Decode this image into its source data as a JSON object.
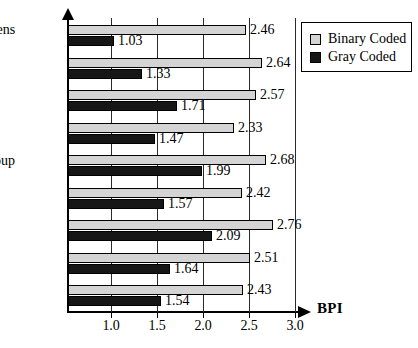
{
  "chart_data": {
    "type": "bar",
    "orientation": "horizontal",
    "title": "",
    "xlabel": "BPI",
    "ylabel": "",
    "xlim": [
      0.53,
      3.05
    ],
    "xticks": [
      "1.0",
      "1.5",
      "2.0",
      "2.5",
      "3.0"
    ],
    "xtick_values": [
      1.0,
      1.5,
      2.0,
      2.5,
      3.0
    ],
    "grid": "vertical",
    "legend_position": "top-right",
    "categories": [
      "fastqueens",
      "qsort",
      "reducer",
      "circuit",
      "semigroup",
      "nand",
      "boyer",
      "browse",
      "chat"
    ],
    "series": [
      {
        "name": "Binary Coded",
        "color": "#d4d4d4",
        "values": [
          2.46,
          2.64,
          2.57,
          2.33,
          2.68,
          2.42,
          2.76,
          2.51,
          2.43
        ],
        "labels": [
          "2.46",
          "2.64",
          "2.57",
          "2.33",
          "2.68",
          "2.42",
          "2.76",
          "2.51",
          "2.43"
        ]
      },
      {
        "name": "Gray Coded",
        "color": "#161616",
        "values": [
          1.03,
          1.33,
          1.71,
          1.47,
          1.99,
          1.57,
          2.09,
          1.64,
          1.54
        ],
        "labels": [
          "1.03",
          "1.33",
          "1.71",
          "1.47",
          "1.99",
          "1.57",
          "2.09",
          "1.64",
          "1.54"
        ]
      }
    ]
  },
  "legend": {
    "entries": [
      {
        "label": "Binary Coded",
        "swatch": "binary"
      },
      {
        "label": "Gray Coded",
        "swatch": "gray"
      }
    ]
  }
}
